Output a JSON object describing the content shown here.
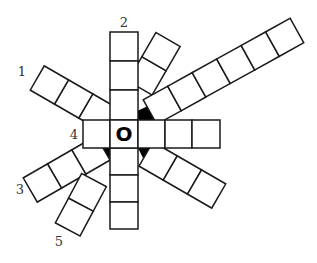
{
  "diagram": {
    "center_letter": "O",
    "labels": [
      {
        "id": "1",
        "text": "1",
        "x": 22,
        "y": 76
      },
      {
        "id": "2",
        "text": "2",
        "x": 124,
        "y": 26
      },
      {
        "id": "3",
        "text": "3",
        "x": 20,
        "y": 194
      },
      {
        "id": "4",
        "text": "4",
        "x": 74,
        "y": 138
      },
      {
        "id": "5",
        "text": "5",
        "x": 59,
        "y": 245
      }
    ],
    "colors": {
      "stroke": "#1a1a1a",
      "wedge": "#000000",
      "background": "#ffffff"
    }
  }
}
